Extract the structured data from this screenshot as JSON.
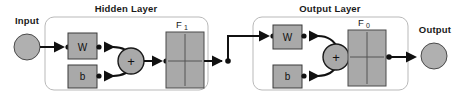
{
  "diagram": {
    "width": 469,
    "height": 102,
    "background_color": "#ffffff"
  },
  "colors": {
    "fill_gray": "#a9a9a9",
    "node_gray": "#b0b0b0",
    "box_outline": "#3a3a3a",
    "layer_outline": "#b9b9b9",
    "wire": "#111111",
    "text": "#1a1a1a"
  },
  "endpoints": {
    "input": {
      "label": "Input",
      "icon": "circle-node"
    },
    "output": {
      "label": "Output",
      "icon": "circle-node"
    }
  },
  "layers": [
    {
      "id": "hidden",
      "title": "Hidden Layer",
      "weight": {
        "label": "W",
        "name": "weight-matrix"
      },
      "bias": {
        "label": "b",
        "name": "bias-vector"
      },
      "summation": {
        "label": "+",
        "name": "summation-node"
      },
      "transfer_function": {
        "label": "F",
        "subscript": "1",
        "name": "transfer-function-block"
      }
    },
    {
      "id": "output",
      "title": "Output Layer",
      "weight": {
        "label": "W",
        "name": "weight-matrix"
      },
      "bias": {
        "label": "b",
        "name": "bias-vector"
      },
      "summation": {
        "label": "+",
        "name": "summation-node"
      },
      "transfer_function": {
        "label": "F",
        "subscript": "0",
        "name": "transfer-function-block"
      }
    }
  ],
  "connections": [
    {
      "name": "input-to-hidden-weight",
      "from": "input",
      "to": "hidden.W"
    },
    {
      "name": "hidden-weight-to-sum",
      "from": "hidden.W",
      "to": "hidden.sum"
    },
    {
      "name": "hidden-bias-to-sum",
      "from": "hidden.b",
      "to": "hidden.sum"
    },
    {
      "name": "hidden-sum-to-transfer",
      "from": "hidden.sum",
      "to": "hidden.F1"
    },
    {
      "name": "hidden-transfer-to-output-weight",
      "from": "hidden.F1",
      "to": "output.W"
    },
    {
      "name": "output-weight-to-sum",
      "from": "output.W",
      "to": "output.sum"
    },
    {
      "name": "output-bias-to-sum",
      "from": "output.b",
      "to": "output.sum"
    },
    {
      "name": "output-sum-to-transfer",
      "from": "output.sum",
      "to": "output.F0"
    },
    {
      "name": "output-transfer-to-output-node",
      "from": "output.F0",
      "to": "output"
    }
  ]
}
